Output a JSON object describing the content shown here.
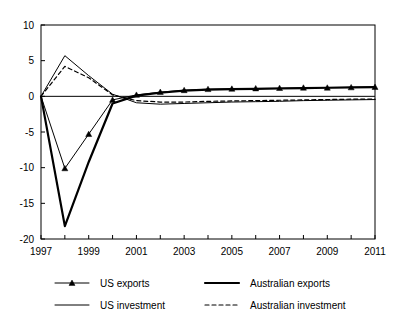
{
  "chart_data": {
    "type": "line",
    "title": "",
    "subtitle": "",
    "xlabel": "",
    "ylabel": "",
    "xlim": [
      1997,
      2011
    ],
    "ylim": [
      -20,
      10
    ],
    "grid": false,
    "legend_position": "bottom",
    "x": [
      1997,
      1998,
      1999,
      2000,
      2001,
      2002,
      2003,
      2004,
      2005,
      2006,
      2007,
      2008,
      2009,
      2010,
      2011
    ],
    "x_tick_labels": [
      "1997",
      "1999",
      "2001",
      "2003",
      "2005",
      "2007",
      "2009",
      "2011"
    ],
    "x_tick_values": [
      1997,
      1999,
      2001,
      2003,
      2005,
      2007,
      2009,
      2011
    ],
    "y_tick_labels": [
      "10",
      "5",
      "0",
      "-5",
      "-10",
      "-15",
      "-20"
    ],
    "y_tick_values": [
      10,
      5,
      0,
      -5,
      -10,
      -15,
      -20
    ],
    "series": [
      {
        "name": "US exports",
        "style": "thin-with-markers",
        "marker": "triangle",
        "color": "#000000",
        "values": [
          0,
          -10.1,
          -5.3,
          -0.5,
          0.2,
          0.6,
          0.85,
          1.0,
          1.05,
          1.1,
          1.15,
          1.2,
          1.2,
          1.25,
          1.3
        ]
      },
      {
        "name": "Australian exports",
        "style": "thick-solid",
        "marker": "none",
        "color": "#000000",
        "values": [
          0,
          -18.2,
          -9.2,
          -1.0,
          0.1,
          0.5,
          0.8,
          0.95,
          1.0,
          1.05,
          1.1,
          1.15,
          1.2,
          1.25,
          1.3
        ]
      },
      {
        "name": "US investment",
        "style": "thin-solid",
        "marker": "none",
        "color": "#000000",
        "values": [
          0,
          5.7,
          2.9,
          0.3,
          -0.9,
          -1.1,
          -1.0,
          -0.9,
          -0.8,
          -0.75,
          -0.7,
          -0.6,
          -0.55,
          -0.5,
          -0.45
        ]
      },
      {
        "name": "Australian investment",
        "style": "dashed",
        "marker": "none",
        "color": "#000000",
        "values": [
          0,
          4.2,
          2.6,
          0.2,
          -0.6,
          -0.8,
          -0.8,
          -0.7,
          -0.65,
          -0.6,
          -0.55,
          -0.5,
          -0.45,
          -0.4,
          -0.4
        ]
      }
    ]
  },
  "legend": {
    "entries": [
      {
        "label": "US exports"
      },
      {
        "label": "Australian exports"
      },
      {
        "label": "US investment"
      },
      {
        "label": "Australian investment"
      }
    ]
  }
}
